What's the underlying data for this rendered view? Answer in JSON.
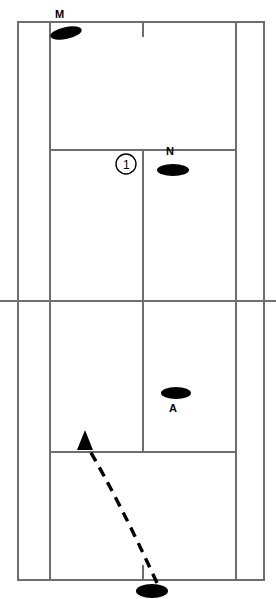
{
  "diagram": {
    "type": "tennis-court-tactical-diagram",
    "width": 276,
    "height": 599,
    "background_color": "#ffffff",
    "line_color": "#6e6e6e",
    "mark_color": "#000000"
  },
  "labels": {
    "player_m": "M",
    "player_n": "N",
    "player_a": "A",
    "sequence_marker_1": "1"
  },
  "players": [
    {
      "id": "player-m",
      "label": "M",
      "cx": 66,
      "cy": 33,
      "rx": 16,
      "ry": 6,
      "rotation": -12,
      "label_x": 55,
      "label_y": 9
    },
    {
      "id": "player-n",
      "label": "N",
      "cx": 173,
      "cy": 170,
      "rx": 16,
      "ry": 6,
      "rotation": 0,
      "label_x": 166,
      "label_y": 146
    },
    {
      "id": "player-a",
      "label": "A",
      "cx": 176,
      "cy": 393,
      "rx": 15,
      "ry": 6,
      "rotation": 0,
      "label_x": 169,
      "label_y": 403
    },
    {
      "id": "player-server",
      "label": "",
      "cx": 152,
      "cy": 591,
      "rx": 16,
      "ry": 7,
      "rotation": 0,
      "label_x": null,
      "label_y": null
    }
  ],
  "markers": [
    {
      "id": "marker-1",
      "text": "1",
      "cx": 126,
      "cy": 164,
      "r": 10
    }
  ],
  "shots": [
    {
      "id": "shot-1",
      "style": "dashed",
      "from_x": 157,
      "from_y": 583,
      "to_x": 85,
      "to_y": 444,
      "control_x": 122,
      "control_y": 500,
      "arrow_tip_x": 85,
      "arrow_tip_y": 431
    }
  ],
  "court": {
    "outer_left": 18,
    "outer_right": 264,
    "singles_left": 50,
    "singles_right": 236,
    "center_line": 143,
    "top_baseline": 22,
    "bottom_baseline": 580,
    "net_y": 301,
    "service_line_top": 150,
    "service_line_bottom": 452,
    "center_mark_top": {
      "x": 143,
      "y1": 22,
      "y2": 36
    },
    "center_mark_bottom": {
      "x": 143,
      "y1": 566,
      "y2": 580
    }
  }
}
